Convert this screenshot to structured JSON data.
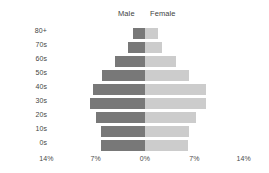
{
  "chart_data": {
    "type": "bar",
    "title": "",
    "subtitle": "",
    "xlabel": "",
    "ylabel": "",
    "orientation": "horizontal-diverging",
    "layout": "population-pyramid",
    "grid": false,
    "legend_position": "top-center",
    "center_value": 0,
    "xlim": [
      -14,
      14
    ],
    "xticks": [
      -14,
      -7,
      0,
      7,
      14
    ],
    "xtick_labels": [
      "14%",
      "7%",
      "0%",
      "7%",
      "14%"
    ],
    "categories": [
      "80+",
      "70s",
      "60s",
      "50s",
      "40s",
      "30s",
      "20s",
      "10s",
      "0s"
    ],
    "series": [
      {
        "name": "Male",
        "color": "#787878",
        "direction": "left",
        "values": [
          1.7,
          2.4,
          4.2,
          6.1,
          7.4,
          7.8,
          6.9,
          6.3,
          6.3
        ]
      },
      {
        "name": "Female",
        "color": "#cccccc",
        "direction": "right",
        "values": [
          1.8,
          2.4,
          4.4,
          6.3,
          8.6,
          8.6,
          7.3,
          6.2,
          6.1
        ]
      }
    ]
  },
  "legend": {
    "male_label": "Male",
    "female_label": "Female"
  },
  "axis": {
    "ticks": [
      {
        "label": "14%",
        "value": -14
      },
      {
        "label": "7%",
        "value": -7
      },
      {
        "label": "0%",
        "value": 0
      },
      {
        "label": "7%",
        "value": 7
      },
      {
        "label": "14%",
        "value": 14
      }
    ]
  },
  "colors": {
    "background": "#ffffff",
    "text": "#464646",
    "male_bar": "#787878",
    "female_bar": "#cccccc"
  }
}
